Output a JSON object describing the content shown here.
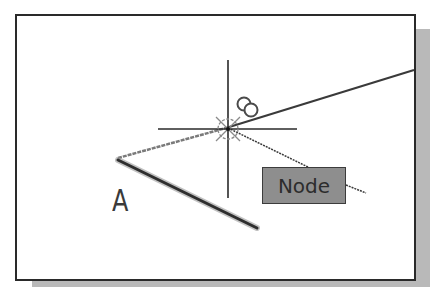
{
  "diagram": {
    "type": "cad-object-snap-illustration",
    "point_label": "A",
    "snap_tooltip": "Node",
    "cursor": "crosshair",
    "snap_marker": "node-snap-marker",
    "colors": {
      "background": "#ffffff",
      "frame_border": "#2a2a2a",
      "shadow": "#b9b9b9",
      "tooltip_fill": "#8e8e8e",
      "lines": "#3a3a3a"
    }
  }
}
